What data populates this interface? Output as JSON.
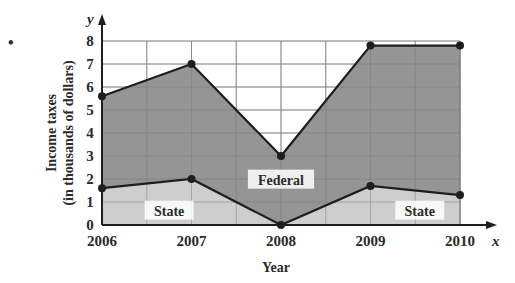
{
  "chart_data": {
    "type": "area",
    "title": "",
    "xlabel": "Year",
    "ylabel": "Income taxes (in thousands of dollars)",
    "ylabel_lines": [
      "Income taxes",
      "(in thousands of dollars)"
    ],
    "x_axis_var": "x",
    "y_axis_var": "y",
    "categories": [
      "2006",
      "2007",
      "2008",
      "2009",
      "2010"
    ],
    "x": [
      2006,
      2007,
      2008,
      2009,
      2010
    ],
    "series": [
      {
        "name": "Federal",
        "values": [
          5.6,
          7.0,
          3.0,
          7.8,
          7.8
        ],
        "fill": "#8f8f8f"
      },
      {
        "name": "State",
        "values": [
          1.6,
          2.0,
          0.0,
          1.7,
          1.3
        ],
        "fill": "#c9c9c9"
      }
    ],
    "annotations": [
      {
        "text": "Federal",
        "x": 2008,
        "y": 1.95
      },
      {
        "text": "State",
        "x": 2006.75,
        "y": 0.6
      },
      {
        "text": "State",
        "x": 2009.55,
        "y": 0.6
      }
    ],
    "yticks": [
      0,
      1,
      2,
      3,
      4,
      5,
      6,
      7,
      8
    ],
    "ylim": [
      0,
      8
    ],
    "xlim": [
      2006,
      2010
    ],
    "grid": true,
    "grid_x_step": 0.5,
    "grid_y_step": 1,
    "legend": "none"
  },
  "bullet": "•",
  "colors": {
    "line": "#1e1e1e",
    "grid": "#9a9a9a",
    "federal_fill": "#8f8f8f",
    "state_fill": "#c9c9c9",
    "text": "#2a2a2a"
  }
}
